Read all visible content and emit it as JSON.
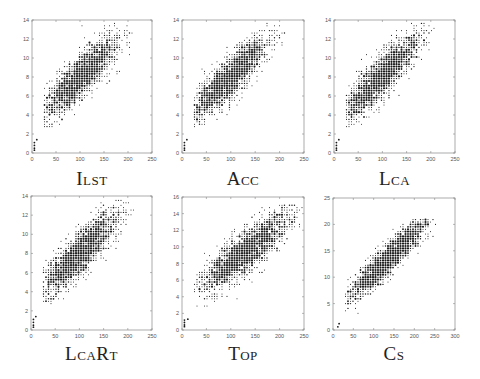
{
  "figure": {
    "panels": [
      {
        "caption": "Ilst"
      },
      {
        "caption": "Acc"
      },
      {
        "caption": "Lca"
      },
      {
        "caption": "LcaRt"
      },
      {
        "caption": "Top"
      },
      {
        "caption": "Cs"
      }
    ]
  },
  "chart_data": [
    {
      "type": "scatter",
      "title": "ILST",
      "xlabel": "",
      "ylabel": "",
      "xlim": [
        0,
        250
      ],
      "ylim": [
        0,
        14
      ],
      "xticks": [
        0,
        50,
        100,
        150,
        200,
        250
      ],
      "yticks": [
        0,
        2,
        4,
        6,
        8,
        10,
        12,
        14
      ],
      "grid": false,
      "cloud": {
        "x_range": [
          5,
          210
        ],
        "y_range": [
          0.2,
          13.6
        ],
        "center": [
          100,
          8
        ],
        "slope": 0.047,
        "intercept": 3.3,
        "spread": 1.5,
        "n": 1900,
        "seed": 11
      },
      "points_low": [
        [
          5,
          0.3
        ],
        [
          5,
          0.5
        ],
        [
          5,
          0.8
        ],
        [
          5,
          1.1
        ],
        [
          10,
          1.4
        ]
      ]
    },
    {
      "type": "scatter",
      "title": "ACC",
      "xlabel": "",
      "ylabel": "",
      "xlim": [
        0,
        250
      ],
      "ylim": [
        0,
        14
      ],
      "xticks": [
        0,
        50,
        100,
        150,
        200,
        250
      ],
      "yticks": [
        0,
        2,
        4,
        6,
        8,
        10,
        12,
        14
      ],
      "grid": false,
      "cloud": {
        "x_range": [
          5,
          210
        ],
        "y_range": [
          0.2,
          13.6
        ],
        "center": [
          95,
          7.8
        ],
        "slope": 0.048,
        "intercept": 3.2,
        "spread": 1.5,
        "n": 1900,
        "seed": 23
      },
      "points_low": [
        [
          5,
          0.3
        ],
        [
          5,
          0.5
        ],
        [
          5,
          0.8
        ],
        [
          5,
          1.1
        ],
        [
          10,
          1.4
        ]
      ]
    },
    {
      "type": "scatter",
      "title": "LCA",
      "xlabel": "",
      "ylabel": "",
      "xlim": [
        0,
        250
      ],
      "ylim": [
        0,
        14
      ],
      "xticks": [
        0,
        50,
        100,
        150,
        200,
        250
      ],
      "yticks": [
        0,
        2,
        4,
        6,
        8,
        10,
        12,
        14
      ],
      "grid": false,
      "cloud": {
        "x_range": [
          5,
          210
        ],
        "y_range": [
          0.2,
          13.6
        ],
        "center": [
          95,
          7.8
        ],
        "slope": 0.05,
        "intercept": 3.1,
        "spread": 1.5,
        "n": 1900,
        "seed": 37
      },
      "points_low": [
        [
          5,
          0.3
        ],
        [
          5,
          0.5
        ],
        [
          5,
          0.8
        ],
        [
          5,
          1.1
        ],
        [
          10,
          1.4
        ]
      ]
    },
    {
      "type": "scatter",
      "title": "LCART",
      "xlabel": "",
      "ylabel": "",
      "xlim": [
        0,
        250
      ],
      "ylim": [
        0,
        14
      ],
      "xticks": [
        0,
        50,
        100,
        150,
        200,
        250
      ],
      "yticks": [
        0,
        2,
        4,
        6,
        8,
        10,
        12,
        14
      ],
      "grid": false,
      "cloud": {
        "x_range": [
          5,
          210
        ],
        "y_range": [
          0.2,
          13.6
        ],
        "center": [
          100,
          8
        ],
        "slope": 0.047,
        "intercept": 3.3,
        "spread": 1.5,
        "n": 1900,
        "seed": 41
      },
      "points_low": [
        [
          5,
          0.3
        ],
        [
          5,
          0.5
        ],
        [
          5,
          0.8
        ],
        [
          5,
          1.1
        ],
        [
          10,
          1.4
        ]
      ]
    },
    {
      "type": "scatter",
      "title": "TOP",
      "xlabel": "",
      "ylabel": "",
      "xlim": [
        0,
        250
      ],
      "ylim": [
        0,
        16
      ],
      "xticks": [
        0,
        50,
        100,
        150,
        200,
        250
      ],
      "yticks": [
        0,
        2,
        4,
        6,
        8,
        10,
        12,
        14,
        16
      ],
      "grid": false,
      "cloud": {
        "x_range": [
          5,
          248
        ],
        "y_range": [
          0.2,
          15.2
        ],
        "center": [
          130,
          9.5
        ],
        "slope": 0.045,
        "intercept": 3.6,
        "spread": 1.7,
        "n": 2100,
        "seed": 53
      },
      "points_low": [
        [
          5,
          0.4
        ],
        [
          5,
          0.6
        ],
        [
          5,
          0.9
        ],
        [
          5,
          1.2
        ],
        [
          12,
          1.3
        ]
      ]
    },
    {
      "type": "scatter",
      "title": "CS",
      "xlabel": "",
      "ylabel": "",
      "xlim": [
        0,
        300
      ],
      "ylim": [
        0,
        25
      ],
      "xticks": [
        0,
        50,
        100,
        150,
        200,
        250,
        300
      ],
      "yticks": [
        0,
        5,
        10,
        15,
        20,
        25
      ],
      "grid": false,
      "cloud": {
        "x_range": [
          12,
          265
        ],
        "y_range": [
          0.5,
          21
        ],
        "center": [
          140,
          13.5
        ],
        "slope": 0.075,
        "intercept": 3.3,
        "spread": 2.0,
        "n": 1900,
        "seed": 67
      },
      "points_low": [
        [
          12,
          0.6
        ],
        [
          15,
          1.2
        ]
      ]
    }
  ],
  "layout": {
    "panels": [
      {
        "x": 32,
        "y": 20,
        "w": 120,
        "h": 133,
        "cap_y": 168
      },
      {
        "x": 182,
        "y": 20,
        "w": 122,
        "h": 133,
        "cap_y": 168
      },
      {
        "x": 334,
        "y": 20,
        "w": 121,
        "h": 133,
        "cap_y": 168
      },
      {
        "x": 31,
        "y": 196,
        "w": 121,
        "h": 134,
        "cap_y": 343
      },
      {
        "x": 182,
        "y": 197,
        "w": 122,
        "h": 133,
        "cap_y": 343
      },
      {
        "x": 333,
        "y": 198,
        "w": 122,
        "h": 132,
        "cap_y": 343
      }
    ],
    "colors": {
      "frame": "#888888",
      "dot": "#1a1a1a",
      "text": "#555555"
    }
  }
}
